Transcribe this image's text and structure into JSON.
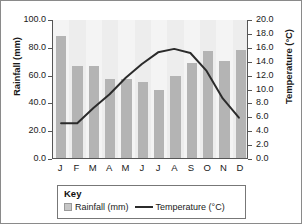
{
  "chart_data": {
    "type": "bar",
    "title": "",
    "categories": [
      "J",
      "F",
      "M",
      "A",
      "M",
      "J",
      "J",
      "A",
      "S",
      "O",
      "N",
      "D"
    ],
    "month_names": [
      "January",
      "February",
      "March",
      "April",
      "May",
      "June",
      "July",
      "August",
      "September",
      "October",
      "November",
      "December"
    ],
    "series": [
      {
        "name": "Rainfall (mm)",
        "type": "bar",
        "axis": "left",
        "unit": "mm",
        "color": "#b4b4b4",
        "values": [
          88,
          66,
          66,
          57,
          57,
          55,
          49,
          59,
          68,
          77,
          70,
          78
        ]
      },
      {
        "name": "Temperature (°C)",
        "type": "line",
        "axis": "right",
        "unit": "°C",
        "color": "#2b2b2b",
        "values": [
          5.0,
          5.0,
          7.2,
          9.2,
          11.6,
          13.6,
          15.3,
          15.8,
          15.2,
          12.6,
          8.6,
          5.8
        ]
      }
    ],
    "xlabel": "",
    "ylabel": "Rainfall (mm)",
    "y2label": "Temperature (°C)",
    "ylim": [
      0,
      100
    ],
    "y2lim": [
      0,
      20
    ],
    "yticks": [
      "0.0",
      "20.0",
      "40.0",
      "60.0",
      "80.0",
      "100.0"
    ],
    "y2ticks": [
      "0.0",
      "2.0",
      "4.0",
      "6.0",
      "8.0",
      "10.0",
      "12.0",
      "14.0",
      "16.0",
      "18.0",
      "20.0"
    ],
    "grid": false,
    "legend_position": "bottom"
  },
  "axes": {
    "left_title": "Rainfall (mm)",
    "right_title": "Temperature (°C)"
  },
  "legend": {
    "title": "Key",
    "entries": [
      {
        "label": "Rainfall (mm)",
        "marker": "bar-swatch"
      },
      {
        "label": "Temperature (°C)",
        "marker": "line-swatch"
      }
    ]
  }
}
